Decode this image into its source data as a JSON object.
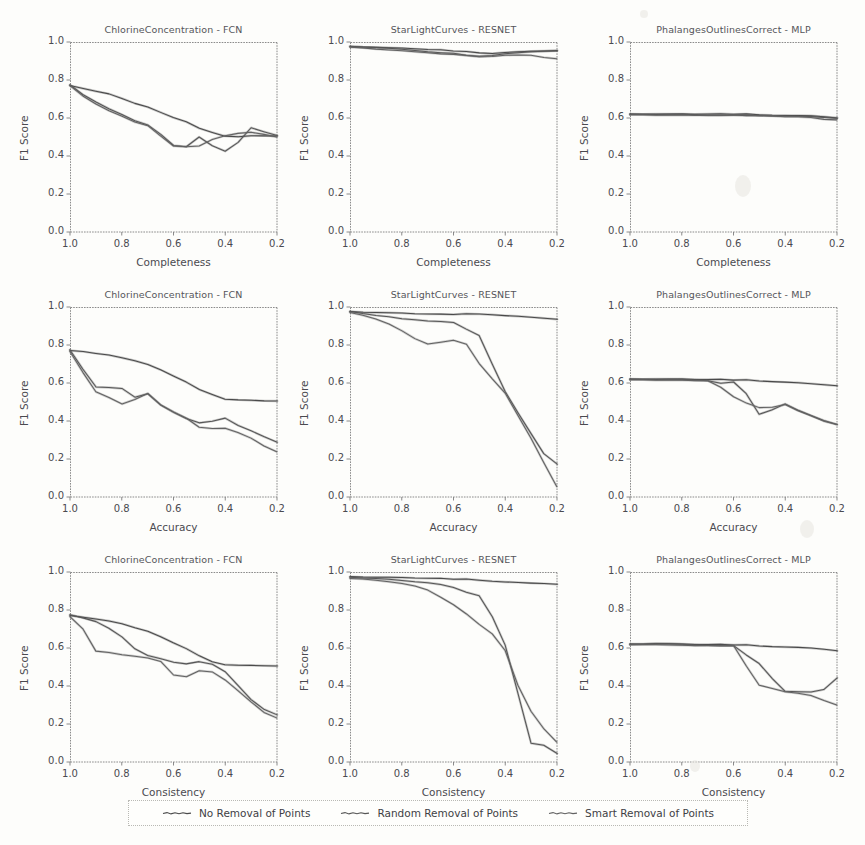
{
  "figure": {
    "background": "#fdfdfb",
    "ink": "#4a4a4a"
  },
  "axis": {
    "ylabel": "F1 Score",
    "yticks": [
      "0.0",
      "0.2",
      "0.4",
      "0.6",
      "0.8",
      "1.0"
    ],
    "ytick_values": [
      0.0,
      0.2,
      0.4,
      0.6,
      0.8,
      1.0
    ],
    "xticks": [
      "1.0",
      "0.8",
      "0.6",
      "0.4",
      "0.2"
    ],
    "xtick_values": [
      1.0,
      0.8,
      0.6,
      0.4,
      0.2
    ],
    "ylim": [
      0.0,
      1.0
    ],
    "xlim": [
      1.0,
      0.2
    ],
    "x_reversed": true,
    "grid": false
  },
  "legend": {
    "position": "bottom-center",
    "entries": [
      {
        "label": "No Removal of Points",
        "color": "#4a4a4a"
      },
      {
        "label": "Random Removal of Points",
        "color": "#565656"
      },
      {
        "label": "Smart Removal of Points",
        "color": "#626262"
      }
    ]
  },
  "chart_data": [
    {
      "type": "line",
      "title": "ChlorineConcentration - FCN",
      "xlabel": "Completeness",
      "ylabel": "F1 Score",
      "xlim": [
        1.0,
        0.2
      ],
      "ylim": [
        0.0,
        1.0
      ],
      "grid": false,
      "x": [
        1.0,
        0.95,
        0.9,
        0.85,
        0.8,
        0.75,
        0.7,
        0.65,
        0.6,
        0.55,
        0.5,
        0.45,
        0.4,
        0.35,
        0.3,
        0.25,
        0.2
      ],
      "series": [
        {
          "name": "No Removal of Points",
          "values": [
            0.77,
            0.755,
            0.74,
            0.725,
            0.7,
            0.675,
            0.655,
            0.625,
            0.6,
            0.575,
            0.545,
            0.525,
            0.505,
            0.5,
            0.505,
            0.505,
            0.505
          ]
        },
        {
          "name": "Random Removal of Points",
          "values": [
            0.77,
            0.72,
            0.68,
            0.645,
            0.615,
            0.585,
            0.565,
            0.515,
            0.455,
            0.45,
            0.5,
            0.455,
            0.425,
            0.47,
            0.545,
            0.525,
            0.505
          ]
        },
        {
          "name": "Smart Removal of Points",
          "values": [
            0.77,
            0.715,
            0.675,
            0.64,
            0.61,
            0.58,
            0.56,
            0.505,
            0.45,
            0.445,
            0.45,
            0.485,
            0.505,
            0.515,
            0.52,
            0.515,
            0.5
          ]
        }
      ]
    },
    {
      "type": "line",
      "title": "StarLightCurves - RESNET",
      "xlabel": "Completeness",
      "ylabel": "F1 Score",
      "xlim": [
        1.0,
        0.2
      ],
      "ylim": [
        0.0,
        1.0
      ],
      "grid": false,
      "x": [
        1.0,
        0.95,
        0.9,
        0.85,
        0.8,
        0.75,
        0.7,
        0.65,
        0.6,
        0.55,
        0.5,
        0.45,
        0.4,
        0.35,
        0.3,
        0.25,
        0.2
      ],
      "series": [
        {
          "name": "No Removal of Points",
          "values": [
            0.975,
            0.973,
            0.971,
            0.968,
            0.965,
            0.962,
            0.958,
            0.955,
            0.95,
            0.945,
            0.942,
            0.94,
            0.945,
            0.948,
            0.95,
            0.952,
            0.955
          ]
        },
        {
          "name": "Random Removal of Points",
          "values": [
            0.973,
            0.97,
            0.967,
            0.963,
            0.958,
            0.955,
            0.95,
            0.945,
            0.94,
            0.932,
            0.925,
            0.93,
            0.938,
            0.942,
            0.945,
            0.948,
            0.95
          ]
        },
        {
          "name": "Smart Removal of Points",
          "values": [
            0.972,
            0.968,
            0.964,
            0.96,
            0.955,
            0.95,
            0.944,
            0.938,
            0.932,
            0.925,
            0.92,
            0.922,
            0.928,
            0.928,
            0.925,
            0.92,
            0.912
          ]
        }
      ]
    },
    {
      "type": "line",
      "title": "PhalangesOutlinesCorrect - MLP",
      "xlabel": "Completeness",
      "ylabel": "F1 Score",
      "xlim": [
        1.0,
        0.2
      ],
      "ylim": [
        0.0,
        1.0
      ],
      "grid": false,
      "x": [
        1.0,
        0.95,
        0.9,
        0.85,
        0.8,
        0.75,
        0.7,
        0.65,
        0.6,
        0.55,
        0.5,
        0.45,
        0.4,
        0.35,
        0.3,
        0.25,
        0.2
      ],
      "series": [
        {
          "name": "No Removal of Points",
          "values": [
            0.618,
            0.618,
            0.618,
            0.618,
            0.618,
            0.618,
            0.618,
            0.618,
            0.618,
            0.617,
            0.616,
            0.615,
            0.614,
            0.612,
            0.61,
            0.606,
            0.6
          ]
        },
        {
          "name": "Random Removal of Points",
          "values": [
            0.617,
            0.617,
            0.617,
            0.617,
            0.617,
            0.617,
            0.616,
            0.616,
            0.615,
            0.614,
            0.613,
            0.612,
            0.61,
            0.607,
            0.604,
            0.6,
            0.596
          ]
        },
        {
          "name": "Smart Removal of Points",
          "values": [
            0.616,
            0.616,
            0.616,
            0.616,
            0.616,
            0.615,
            0.615,
            0.614,
            0.613,
            0.612,
            0.61,
            0.608,
            0.605,
            0.602,
            0.598,
            0.594,
            0.59
          ]
        }
      ]
    },
    {
      "type": "line",
      "title": "ChlorineConcentration - FCN",
      "xlabel": "Accuracy",
      "ylabel": "F1 Score",
      "xlim": [
        1.0,
        0.2
      ],
      "ylim": [
        0.0,
        1.0
      ],
      "grid": false,
      "x": [
        1.0,
        0.95,
        0.9,
        0.85,
        0.8,
        0.75,
        0.7,
        0.65,
        0.6,
        0.55,
        0.5,
        0.45,
        0.4,
        0.35,
        0.3,
        0.25,
        0.2
      ],
      "series": [
        {
          "name": "No Removal of Points",
          "values": [
            0.77,
            0.765,
            0.755,
            0.745,
            0.73,
            0.715,
            0.695,
            0.665,
            0.635,
            0.6,
            0.565,
            0.54,
            0.515,
            0.51,
            0.508,
            0.505,
            0.505
          ]
        },
        {
          "name": "Random Removal of Points",
          "values": [
            0.77,
            0.67,
            0.575,
            0.572,
            0.568,
            0.525,
            0.545,
            0.485,
            0.445,
            0.415,
            0.39,
            0.4,
            0.415,
            0.375,
            0.345,
            0.315,
            0.285
          ]
        },
        {
          "name": "Smart Removal of Points",
          "values": [
            0.765,
            0.655,
            0.555,
            0.525,
            0.49,
            0.515,
            0.545,
            0.485,
            0.445,
            0.41,
            0.365,
            0.358,
            0.36,
            0.335,
            0.305,
            0.27,
            0.238
          ]
        }
      ]
    },
    {
      "type": "line",
      "title": "StarLightCurves - RESNET",
      "xlabel": "Accuracy",
      "ylabel": "F1 Score",
      "xlim": [
        1.0,
        0.2
      ],
      "ylim": [
        0.0,
        1.0
      ],
      "grid": false,
      "x": [
        1.0,
        0.95,
        0.9,
        0.85,
        0.8,
        0.75,
        0.7,
        0.65,
        0.6,
        0.55,
        0.5,
        0.45,
        0.4,
        0.35,
        0.3,
        0.25,
        0.2
      ],
      "series": [
        {
          "name": "No Removal of Points",
          "values": [
            0.975,
            0.972,
            0.97,
            0.968,
            0.965,
            0.962,
            0.96,
            0.958,
            0.958,
            0.96,
            0.962,
            0.96,
            0.955,
            0.95,
            0.945,
            0.94,
            0.935
          ]
        },
        {
          "name": "Random Removal of Points",
          "values": [
            0.972,
            0.962,
            0.952,
            0.945,
            0.935,
            0.932,
            0.928,
            0.925,
            0.918,
            0.885,
            0.85,
            0.7,
            0.555,
            0.44,
            0.33,
            0.225,
            0.17
          ]
        },
        {
          "name": "Smart Removal of Points",
          "values": [
            0.97,
            0.955,
            0.938,
            0.912,
            0.875,
            0.835,
            0.805,
            0.815,
            0.822,
            0.8,
            0.7,
            0.62,
            0.545,
            0.425,
            0.305,
            0.18,
            0.055
          ]
        }
      ]
    },
    {
      "type": "line",
      "title": "PhalangesOutlinesCorrect - MLP",
      "xlabel": "Accuracy",
      "ylabel": "F1 Score",
      "xlim": [
        1.0,
        0.2
      ],
      "ylim": [
        0.0,
        1.0
      ],
      "grid": false,
      "x": [
        1.0,
        0.95,
        0.9,
        0.85,
        0.8,
        0.75,
        0.7,
        0.65,
        0.6,
        0.55,
        0.5,
        0.45,
        0.4,
        0.35,
        0.3,
        0.25,
        0.2
      ],
      "series": [
        {
          "name": "No Removal of Points",
          "values": [
            0.618,
            0.618,
            0.618,
            0.618,
            0.618,
            0.617,
            0.616,
            0.615,
            0.613,
            0.612,
            0.61,
            0.608,
            0.605,
            0.6,
            0.595,
            0.59,
            0.585
          ]
        },
        {
          "name": "Random Removal of Points",
          "values": [
            0.617,
            0.617,
            0.617,
            0.617,
            0.616,
            0.615,
            0.613,
            0.6,
            0.605,
            0.545,
            0.435,
            0.46,
            0.49,
            0.455,
            0.425,
            0.4,
            0.378
          ]
        },
        {
          "name": "Smart Removal of Points",
          "values": [
            0.616,
            0.616,
            0.616,
            0.616,
            0.615,
            0.614,
            0.612,
            0.578,
            0.525,
            0.49,
            0.468,
            0.47,
            0.485,
            0.45,
            0.423,
            0.4,
            0.382
          ]
        }
      ]
    },
    {
      "type": "line",
      "title": "ChlorineConcentration - FCN",
      "xlabel": "Consistency",
      "ylabel": "F1 Score",
      "xlim": [
        1.0,
        0.2
      ],
      "ylim": [
        0.0,
        1.0
      ],
      "grid": false,
      "x": [
        1.0,
        0.95,
        0.9,
        0.85,
        0.8,
        0.75,
        0.7,
        0.65,
        0.6,
        0.55,
        0.5,
        0.45,
        0.4,
        0.35,
        0.3,
        0.25,
        0.2
      ],
      "series": [
        {
          "name": "No Removal of Points",
          "values": [
            0.77,
            0.762,
            0.752,
            0.74,
            0.725,
            0.705,
            0.685,
            0.655,
            0.625,
            0.592,
            0.558,
            0.528,
            0.512,
            0.508,
            0.507,
            0.506,
            0.505
          ]
        },
        {
          "name": "Random Removal of Points",
          "values": [
            0.77,
            0.755,
            0.735,
            0.7,
            0.655,
            0.595,
            0.562,
            0.545,
            0.525,
            0.518,
            0.528,
            0.515,
            0.475,
            0.4,
            0.325,
            0.275,
            0.245
          ]
        },
        {
          "name": "Smart Removal of Points",
          "values": [
            0.765,
            0.7,
            0.585,
            0.578,
            0.565,
            0.558,
            0.548,
            0.53,
            0.455,
            0.445,
            0.478,
            0.472,
            0.43,
            0.372,
            0.312,
            0.262,
            0.232
          ]
        }
      ]
    },
    {
      "type": "line",
      "title": "StarLightCurves - RESNET",
      "xlabel": "Consistency",
      "ylabel": "F1 Score",
      "xlim": [
        1.0,
        0.2
      ],
      "ylim": [
        0.0,
        1.0
      ],
      "grid": false,
      "x": [
        1.0,
        0.95,
        0.9,
        0.85,
        0.8,
        0.75,
        0.7,
        0.65,
        0.6,
        0.55,
        0.5,
        0.45,
        0.4,
        0.35,
        0.3,
        0.25,
        0.2
      ],
      "series": [
        {
          "name": "No Removal of Points",
          "values": [
            0.975,
            0.973,
            0.972,
            0.97,
            0.968,
            0.966,
            0.964,
            0.962,
            0.96,
            0.958,
            0.956,
            0.952,
            0.948,
            0.944,
            0.94,
            0.938,
            0.935
          ]
        },
        {
          "name": "Random Removal of Points",
          "values": [
            0.968,
            0.965,
            0.962,
            0.958,
            0.952,
            0.948,
            0.945,
            0.935,
            0.918,
            0.895,
            0.875,
            0.765,
            0.615,
            0.355,
            0.095,
            0.085,
            0.042
          ]
        },
        {
          "name": "Smart Removal of Points",
          "values": [
            0.965,
            0.962,
            0.958,
            0.95,
            0.94,
            0.928,
            0.905,
            0.868,
            0.825,
            0.775,
            0.722,
            0.672,
            0.585,
            0.4,
            0.262,
            0.175,
            0.105
          ]
        }
      ]
    },
    {
      "type": "line",
      "title": "PhalangesOutlinesCorrect - MLP",
      "xlabel": "Consistency",
      "ylabel": "F1 Score",
      "xlim": [
        1.0,
        0.2
      ],
      "ylim": [
        0.0,
        1.0
      ],
      "grid": false,
      "x": [
        1.0,
        0.95,
        0.9,
        0.85,
        0.8,
        0.75,
        0.7,
        0.65,
        0.6,
        0.55,
        0.5,
        0.45,
        0.4,
        0.35,
        0.3,
        0.25,
        0.2
      ],
      "series": [
        {
          "name": "No Removal of Points",
          "values": [
            0.618,
            0.62,
            0.622,
            0.62,
            0.618,
            0.617,
            0.616,
            0.615,
            0.614,
            0.612,
            0.61,
            0.608,
            0.606,
            0.602,
            0.598,
            0.592,
            0.585
          ]
        },
        {
          "name": "Random Removal of Points",
          "values": [
            0.617,
            0.618,
            0.62,
            0.618,
            0.616,
            0.615,
            0.614,
            0.613,
            0.612,
            0.565,
            0.518,
            0.44,
            0.372,
            0.368,
            0.365,
            0.378,
            0.44
          ]
        },
        {
          "name": "Smart Removal of Points",
          "values": [
            0.616,
            0.617,
            0.619,
            0.617,
            0.615,
            0.614,
            0.613,
            0.612,
            0.61,
            0.5,
            0.402,
            0.385,
            0.368,
            0.358,
            0.345,
            0.325,
            0.3
          ]
        }
      ]
    }
  ]
}
